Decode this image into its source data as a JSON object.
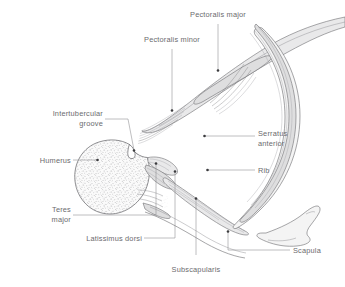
{
  "figure": {
    "type": "anatomical-cross-section",
    "background_color": "#ffffff",
    "line_color": "#6e6e72",
    "text_color": "#6b6b6e",
    "muscle_fill": "#e9e9ea",
    "bone_fill": "#f4f4f4"
  },
  "labels": {
    "pectoralis_major": "Pectoralis major",
    "pectoralis_minor": "Pectoralis minor",
    "intertubercular_1": "Intertubercular",
    "intertubercular_2": "groove",
    "humerus": "Humerus",
    "teres_1": "Teres",
    "teres_2": "major",
    "latissimus_dorsi": "Latissimus dorsi",
    "subscapularis": "Subscapularis",
    "serratus_1": "Serratus",
    "serratus_2": "anterior",
    "rib": "Rib",
    "scapula": "Scapula"
  },
  "structures": [
    {
      "name": "pectoralis-major",
      "kind": "muscle"
    },
    {
      "name": "pectoralis-minor",
      "kind": "muscle"
    },
    {
      "name": "humerus",
      "kind": "bone"
    },
    {
      "name": "intertubercular-groove",
      "kind": "bone-feature"
    },
    {
      "name": "teres-major",
      "kind": "muscle"
    },
    {
      "name": "latissimus-dorsi",
      "kind": "muscle"
    },
    {
      "name": "subscapularis",
      "kind": "muscle"
    },
    {
      "name": "serratus-anterior",
      "kind": "muscle"
    },
    {
      "name": "rib",
      "kind": "bone"
    },
    {
      "name": "scapula",
      "kind": "bone"
    }
  ]
}
